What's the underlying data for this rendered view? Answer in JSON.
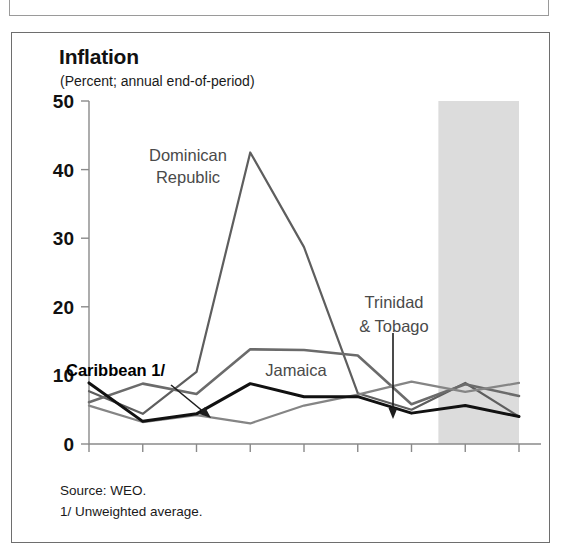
{
  "figure": {
    "title": "Inflation",
    "subtitle": "(Percent; annual end-of-period)",
    "source_note": "Source: WEO.",
    "footnote": "1/ Unweighted average."
  },
  "colors": {
    "caribbean": "#111111",
    "dominican_republic": "#5e5e5e",
    "jamaica": "#6b6b6b",
    "trinidad_tobago": "#858585",
    "forecast_shade": "#dcdcdc",
    "axis": "#8a8a8a",
    "frame": "#6e6e6e"
  },
  "annotations": [
    {
      "name": "dominican-republic",
      "lines": [
        "Dominican",
        "Republic"
      ]
    },
    {
      "name": "jamaica",
      "lines": [
        "Jamaica"
      ]
    },
    {
      "name": "trinidad-tobago",
      "lines": [
        "Trinidad",
        "& Tobago"
      ]
    },
    {
      "name": "caribbean",
      "lines": [
        "Caribbean 1/"
      ]
    }
  ],
  "chart_data": {
    "type": "line",
    "title": "Inflation",
    "subtitle": "(Percent; annual end-of-period)",
    "xlabel": "",
    "ylabel": "",
    "xlim": [
      2000,
      2008
    ],
    "ylim": [
      0,
      50
    ],
    "yticks": [
      0,
      10,
      20,
      30,
      40,
      50
    ],
    "ytick_labels": [
      "0",
      "10",
      "20",
      "30",
      "40",
      "50"
    ],
    "grid": false,
    "legend": "inline-annotations",
    "categories": [
      2000,
      2001,
      2002,
      2003,
      2004,
      2005,
      2006,
      2007,
      2008
    ],
    "xtick_labels": [
      "2000",
      "2001",
      "2002",
      "2003",
      "2004",
      "2005",
      "2006",
      "2007",
      "2008"
    ],
    "forecast_region": {
      "start": 2006.5,
      "end": 2008,
      "label": "projection shading"
    },
    "series": [
      {
        "name": "Dominican Republic",
        "color": "#5e5e5e",
        "width": 2.2,
        "values": [
          7.7,
          4.4,
          10.5,
          42.5,
          28.7,
          7.4,
          5.0,
          8.9,
          4.0
        ]
      },
      {
        "name": "Jamaica",
        "color": "#6b6b6b",
        "width": 2.6,
        "values": [
          6.1,
          8.8,
          7.3,
          13.8,
          13.7,
          12.9,
          5.8,
          8.7,
          7.0
        ]
      },
      {
        "name": "Trinidad & Tobago",
        "color": "#858585",
        "width": 2.2,
        "values": [
          5.6,
          3.2,
          4.2,
          3.0,
          5.6,
          7.2,
          9.1,
          7.6,
          8.9
        ]
      },
      {
        "name": "Caribbean 1/",
        "color": "#111111",
        "width": 3.0,
        "values": [
          8.9,
          3.3,
          4.4,
          8.8,
          6.9,
          6.9,
          4.5,
          5.6,
          4.0
        ]
      }
    ]
  }
}
